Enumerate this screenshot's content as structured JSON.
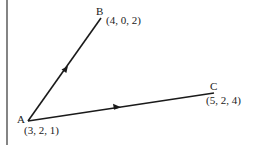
{
  "diagram": {
    "type": "vector-diagram",
    "colors": {
      "line": "#1a1a1a",
      "background": "#ffffff"
    },
    "points": {
      "A": {
        "name": "A",
        "coords": "(3, 2, 1)"
      },
      "B": {
        "name": "B",
        "coords": "(4, 0, 2)"
      },
      "C": {
        "name": "C",
        "coords": "(5, 2, 4)"
      }
    },
    "vectors": [
      {
        "from": "A",
        "to": "B",
        "arrow": true
      },
      {
        "from": "A",
        "to": "C",
        "arrow": true
      }
    ]
  }
}
